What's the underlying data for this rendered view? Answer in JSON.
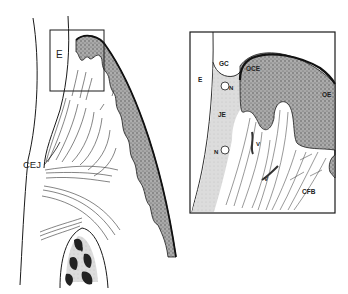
{
  "figure": {
    "type": "histological schematic diagram of gingiva",
    "overview_panel": {
      "labels": {
        "enamel_box": "E",
        "cej": "CEJ"
      }
    },
    "inset_panel": {
      "labels": {
        "enamel": "E",
        "gingival_crevice": "GC",
        "oral_crevicular_epithelium": "OCE",
        "oral_epithelium": "OE",
        "junctional_epithelium": "JE",
        "nucleus_1": "N",
        "nucleus_2": "N",
        "vessel_1": "V",
        "vessel_2": "V",
        "collagen_fiber_bundles": "CFB"
      }
    },
    "colors": {
      "line": "#1a1a1a",
      "stipple_dark": "#8a8a8a",
      "stipple_light": "#c8c8c8",
      "je_fill": "#d9d9d9",
      "background": "#ffffff"
    }
  }
}
